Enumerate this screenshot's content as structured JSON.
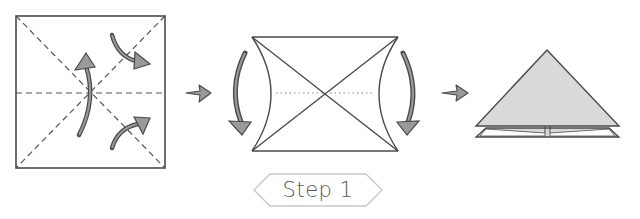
{
  "diagram": {
    "type": "origami-instructions",
    "step": {
      "label": "Step 1"
    },
    "colors": {
      "line": "#4a4a4a",
      "arrow_fill": "#9a9a9a",
      "paper_shaded": "#d9d9d9",
      "badge_border": "#c8c8c8",
      "text": "#555555"
    },
    "panels": [
      {
        "id": "panel-1",
        "description": "Square paper with dashed diagonal and horizontal crease lines; curved fold arrows"
      },
      {
        "id": "panel-2",
        "description": "Square with sides pushed inward forming concave edges; curved arrows pointing down on both sides"
      },
      {
        "id": "panel-3",
        "description": "Resulting folded triangle (waterbomb base) shaded gray"
      }
    ],
    "transition_arrows": 2
  }
}
